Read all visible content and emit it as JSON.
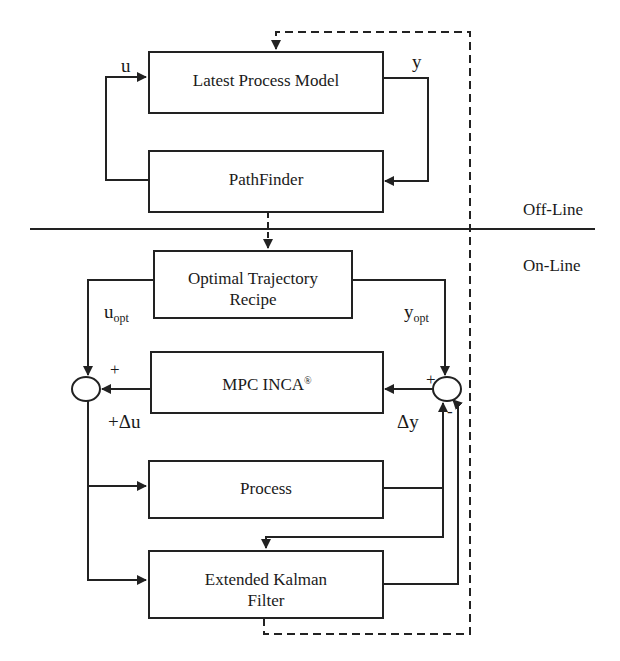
{
  "diagram": {
    "sections": {
      "offline_label": "Off-Line",
      "online_label": "On-Line"
    },
    "blocks": {
      "latest_process_model": "Latest Process Model",
      "pathfinder": "PathFinder",
      "optimal_trajectory_line1": "Optimal Trajectory",
      "optimal_trajectory_line2": "Recipe",
      "mpc_inca": "MPC INCA",
      "mpc_inca_mark": "®",
      "process": "Process",
      "ekf_line1": "Extended Kalman",
      "ekf_line2": "Filter"
    },
    "signals": {
      "u": "u",
      "y": "y",
      "u_opt_base": "u",
      "u_opt_sub": "opt",
      "y_opt_base": "y",
      "y_opt_sub": "opt",
      "delta_u": "+Δu",
      "delta_y": "Δy",
      "plus_left": "+",
      "plus_right": "+",
      "minus_right": "-"
    },
    "colors": {
      "line": "#222222",
      "background": "#ffffff"
    }
  }
}
